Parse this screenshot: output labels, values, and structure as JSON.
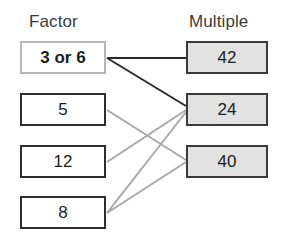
{
  "diagram": {
    "type": "bipartite-mapping",
    "headers": {
      "left": "Factor",
      "right": "Multiple"
    },
    "colors": {
      "factor_box_fill": "#ffffff",
      "factor_box_border": "#2e2e2e",
      "highlight_box_border": "#b6b6b6",
      "multiple_box_fill": "#e2e2e2",
      "multiple_box_border": "#3a3a3a",
      "dark_link": "#2b2b2b",
      "gray_link": "#a8a8a8",
      "header_text": "#3b3b3b",
      "box_text": "#1c1c1c"
    },
    "factors": [
      {
        "id": "f0",
        "label": "3 or 6",
        "highlighted": true,
        "x": 20,
        "y": 41,
        "w": 86,
        "h": 33
      },
      {
        "id": "f1",
        "label": "5",
        "highlighted": false,
        "x": 20,
        "y": 93,
        "w": 86,
        "h": 33
      },
      {
        "id": "f2",
        "label": "12",
        "highlighted": false,
        "x": 20,
        "y": 145,
        "w": 86,
        "h": 33
      },
      {
        "id": "f3",
        "label": "8",
        "highlighted": false,
        "x": 20,
        "y": 196,
        "w": 86,
        "h": 33
      }
    ],
    "multiples": [
      {
        "id": "m0",
        "label": "42",
        "x": 186,
        "y": 41,
        "w": 82,
        "h": 33
      },
      {
        "id": "m1",
        "label": "24",
        "x": 186,
        "y": 93,
        "w": 82,
        "h": 33
      },
      {
        "id": "m2",
        "label": "40",
        "x": 186,
        "y": 145,
        "w": 82,
        "h": 33
      }
    ],
    "links": [
      {
        "from": "f0",
        "to": "m0",
        "style": "dark",
        "x1": 107,
        "y1": 58,
        "x2": 186,
        "y2": 58,
        "width": 2.0
      },
      {
        "from": "f0",
        "to": "m1",
        "style": "dark",
        "x1": 107,
        "y1": 58,
        "x2": 186,
        "y2": 106,
        "width": 2.0
      },
      {
        "from": "f1",
        "to": "m2",
        "style": "gray",
        "x1": 107,
        "y1": 110,
        "x2": 186,
        "y2": 160,
        "width": 2.0
      },
      {
        "from": "f2",
        "to": "m1",
        "style": "gray",
        "x1": 107,
        "y1": 162,
        "x2": 186,
        "y2": 110,
        "width": 2.0
      },
      {
        "from": "f3",
        "to": "m1",
        "style": "gray",
        "x1": 107,
        "y1": 213,
        "x2": 186,
        "y2": 112,
        "width": 2.0
      },
      {
        "from": "f3",
        "to": "m2",
        "style": "gray",
        "x1": 107,
        "y1": 213,
        "x2": 186,
        "y2": 162,
        "width": 2.0
      }
    ]
  }
}
